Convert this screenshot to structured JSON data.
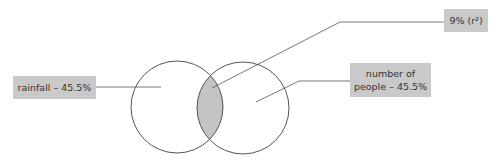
{
  "diagram": {
    "type": "venn",
    "labels": {
      "left": "rainfall – 45.5%",
      "right_line1": "number of",
      "right_line2": "people – 45.5%",
      "overlap": "9% (r²)"
    },
    "colors": {
      "label_bg": "#c9c9c9",
      "overlap_fill": "#c4c4c4",
      "stroke": "#555555"
    }
  }
}
